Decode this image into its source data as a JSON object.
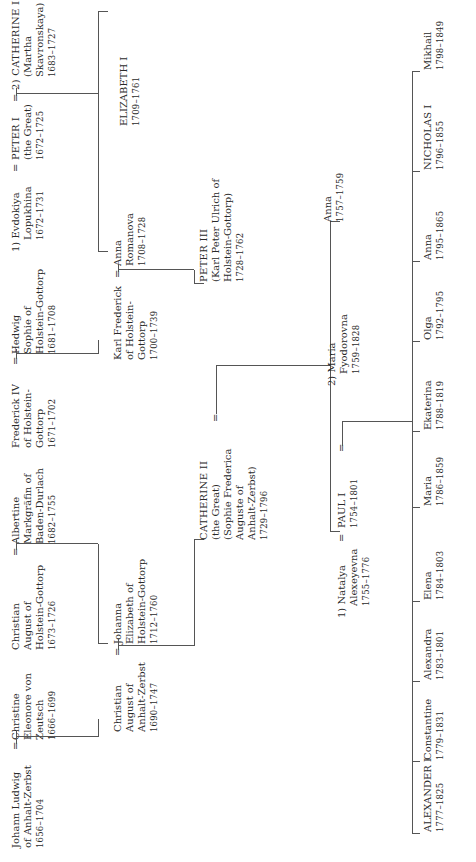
{
  "diagram": {
    "type": "family-tree",
    "orientation": "rotated-90-ccw",
    "line_color": "#555555",
    "generations": [
      {
        "row": 1,
        "people": [
          {
            "id": "johann_ludwig",
            "lines": [
              "Johann Ludwig",
              "of Anhalt-Zerbst"
            ],
            "dates": "1656–1704"
          },
          {
            "id": "christine",
            "lines": [
              "Christine",
              "Eleonore von",
              "Zeutsch"
            ],
            "dates": "1666–1699"
          },
          {
            "id": "christian_august_hg",
            "lines": [
              "Christian",
              "August of",
              "Holstein-Gottorp"
            ],
            "dates": "1673–1726"
          },
          {
            "id": "albertine",
            "lines": [
              "Albertine",
              "Markgräfin of",
              "Baden-Durlach"
            ],
            "dates": "1682–1755"
          },
          {
            "id": "frederick_iv",
            "lines": [
              "Frederick IV",
              "of Holstein-",
              "Gottorp"
            ],
            "dates": "1671–1702"
          },
          {
            "id": "hedwig_sophie",
            "lines": [
              "Hedwig",
              "Sophie of",
              "Holstein-Gottorp"
            ],
            "dates": "1681–1708"
          },
          {
            "id": "evdokiya",
            "lines": [
              "1) Evdokiya",
              "Lopukhina"
            ],
            "dates": "1672–1731"
          },
          {
            "id": "peter_i",
            "lines": [
              "PETER I",
              "(the Great)"
            ],
            "dates": "1672–1725"
          },
          {
            "id": "catherine_i",
            "lines": [
              "2) CATHERINE I",
              "(Martha",
              "Skavronskaya)"
            ],
            "dates": "1683–1727"
          }
        ]
      },
      {
        "row": 2,
        "people": [
          {
            "id": "christian_august_az",
            "lines": [
              "Christian",
              "August of",
              "Anhalt-Zerbst"
            ],
            "dates": "1690–1747"
          },
          {
            "id": "johanna",
            "lines": [
              "Johanna",
              "Elizabeth of",
              "Holstein-Gottorp"
            ],
            "dates": "1712–1760"
          },
          {
            "id": "karl_frederick",
            "lines": [
              "Karl Frederick",
              "of Holstein-",
              "Gottorp"
            ],
            "dates": "1700–1739"
          },
          {
            "id": "anna_romanova",
            "lines": [
              "Anna",
              "Romanova"
            ],
            "dates": "1708–1728"
          },
          {
            "id": "elizabeth_i",
            "lines": [
              "ELIZABETH I"
            ],
            "dates": "1709–1761"
          }
        ]
      },
      {
        "row": 3,
        "people": [
          {
            "id": "catherine_ii",
            "lines": [
              "CATHERINE II",
              "(the Great)",
              "(Sophie Frederica",
              "Auguste of",
              "Anhalt-Zerbst)"
            ],
            "dates": "1729–1796"
          },
          {
            "id": "peter_iii",
            "lines": [
              "PETER III",
              "(Karl Peter Ulrich of",
              "Holstein-Gottorp)"
            ],
            "dates": "1728–1762"
          }
        ]
      },
      {
        "row": 4,
        "people": [
          {
            "id": "natalya",
            "lines": [
              "1) Natalya",
              "Alexeyevna"
            ],
            "dates": "1755–1776"
          },
          {
            "id": "paul_i",
            "lines": [
              "PAUL I"
            ],
            "dates": "1754–1801"
          },
          {
            "id": "maria_fyodorovna",
            "lines": [
              "2) Maria",
              "Fyodorovna"
            ],
            "dates": "1759–1828"
          },
          {
            "id": "anna_1757",
            "lines": [
              "Anna"
            ],
            "dates": "1757–1759"
          }
        ]
      },
      {
        "row": 5,
        "people": [
          {
            "id": "alexander_i",
            "lines": [
              "ALEXANDER I"
            ],
            "dates": "1777–1825"
          },
          {
            "id": "constantine",
            "lines": [
              "Constantine"
            ],
            "dates": "1779–1831"
          },
          {
            "id": "alexandra",
            "lines": [
              "Alexandra"
            ],
            "dates": "1783–1801"
          },
          {
            "id": "elena",
            "lines": [
              "Elena"
            ],
            "dates": "1784–1803"
          },
          {
            "id": "maria",
            "lines": [
              "Maria"
            ],
            "dates": "1786–1859"
          },
          {
            "id": "ekaterina",
            "lines": [
              "Ekaterina"
            ],
            "dates": "1788–1819"
          },
          {
            "id": "olga",
            "lines": [
              "Olga"
            ],
            "dates": "1792–1795"
          },
          {
            "id": "anna_1795",
            "lines": [
              "Anna"
            ],
            "dates": "1795–1865"
          },
          {
            "id": "nicholas_i",
            "lines": [
              "NICHOLAS I"
            ],
            "dates": "1796–1855"
          },
          {
            "id": "mikhail",
            "lines": [
              "Mikhail"
            ],
            "dates": "1798–1849"
          }
        ]
      }
    ],
    "marriage_symbol": "=",
    "marriages": [
      [
        "johann_ludwig",
        "christine"
      ],
      [
        "christian_august_hg",
        "albertine"
      ],
      [
        "frederick_iv",
        "hedwig_sophie"
      ],
      [
        "evdokiya",
        "peter_i"
      ],
      [
        "peter_i",
        "catherine_i"
      ],
      [
        "christian_august_az",
        "johanna"
      ],
      [
        "karl_frederick",
        "anna_romanova"
      ],
      [
        "catherine_ii",
        "peter_iii"
      ],
      [
        "natalya",
        "paul_i"
      ],
      [
        "paul_i",
        "maria_fyodorovna"
      ]
    ]
  }
}
